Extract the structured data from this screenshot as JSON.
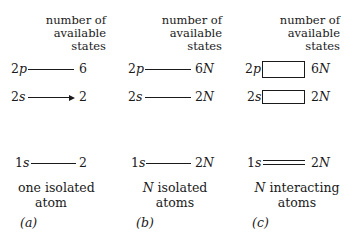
{
  "header_text": {
    "line1": "number of",
    "line2": "available",
    "line3": "states"
  },
  "panels": [
    {
      "id": "a",
      "levels": {
        "2p": {
          "orbital_num": "2",
          "orbital_letter": "p",
          "count": "6"
        },
        "2s": {
          "orbital_num": "2",
          "orbital_letter": "s",
          "count": "2"
        },
        "1s": {
          "orbital_num": "1",
          "orbital_letter": "s",
          "count": "2"
        }
      },
      "caption_line1_prefix": "",
      "caption_line1": "one isolated",
      "caption_line2": "atom",
      "label": "(a)",
      "level_style": "line"
    },
    {
      "id": "b",
      "levels": {
        "2p": {
          "orbital_num": "2",
          "orbital_letter": "p",
          "count_num": "6",
          "count_var": "N"
        },
        "2s": {
          "orbital_num": "2",
          "orbital_letter": "s",
          "count_num": "2",
          "count_var": "N"
        },
        "1s": {
          "orbital_num": "1",
          "orbital_letter": "s",
          "count_num": "2",
          "count_var": "N"
        }
      },
      "caption_line1_prefix": "N",
      "caption_line1": " isolated",
      "caption_line2": "atoms",
      "label": "(b)",
      "level_style": "line"
    },
    {
      "id": "c",
      "levels": {
        "2p": {
          "orbital_num": "2",
          "orbital_letter": "p",
          "count_num": "6",
          "count_var": "N"
        },
        "2s": {
          "orbital_num": "2",
          "orbital_letter": "s",
          "count_num": "2",
          "count_var": "N"
        },
        "1s": {
          "orbital_num": "1",
          "orbital_letter": "s",
          "count_num": "2",
          "count_var": "N"
        }
      },
      "caption_line1_prefix": "N",
      "caption_line1": " interacting",
      "caption_line2": "atoms",
      "label": "(c)",
      "level_style": "band"
    }
  ],
  "colors": {
    "ink": "#1a1a1a",
    "background": "#ffffff"
  }
}
